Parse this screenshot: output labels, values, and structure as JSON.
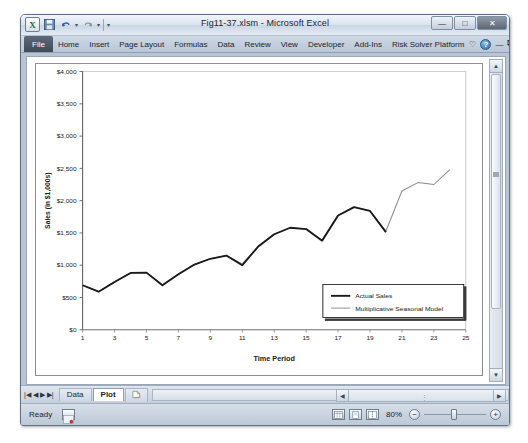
{
  "window": {
    "title": "Fig11-37.xlsm - Microsoft Excel",
    "quick_access": {
      "excel_logo": "X",
      "save_icon": "save-icon",
      "undo_icon": "undo-icon",
      "redo_icon": "redo-icon",
      "customize_icon": "customize-icon"
    },
    "buttons": {
      "minimize": "—",
      "maximize": "□",
      "close": "✕"
    }
  },
  "ribbon": {
    "file_tab": "File",
    "tabs": [
      "Home",
      "Insert",
      "Page Layout",
      "Formulas",
      "Data",
      "Review",
      "View",
      "Developer",
      "Add-Ins",
      "Risk Solver Platform"
    ],
    "right_icons": {
      "collapse": "♡",
      "help": "?",
      "minimize_ribbon": "—",
      "restore_window": "⧉",
      "close_window": "✕"
    }
  },
  "sheet_tabs": {
    "nav": [
      "|◀",
      "◀",
      "▶",
      "▶|"
    ],
    "items": [
      {
        "label": "Data",
        "active": false
      },
      {
        "label": "Plot",
        "active": true
      }
    ],
    "new_sheet_icon": "new-sheet-icon"
  },
  "status_bar": {
    "state": "Ready",
    "macro_record_icon": "macro-record-icon",
    "view_normal": "normal-view-icon",
    "view_page_layout": "page-layout-view-icon",
    "view_page_break": "page-break-view-icon",
    "zoom_level": "80%",
    "zoom_out": "−",
    "zoom_in": "+"
  },
  "scrollbars": {
    "vertical_up": "▲",
    "vertical_down": "▼",
    "horizontal_left": "◀",
    "horizontal_right": "▶"
  },
  "chart_data": {
    "type": "line",
    "title": "",
    "xlabel": "Time Period",
    "ylabel": "Sales (in $1,000s)",
    "xlim": [
      1,
      25
    ],
    "ylim": [
      0,
      4000
    ],
    "ytick_step": 500,
    "ytick_labels": [
      "$0",
      "$500",
      "$1,000",
      "$1,500",
      "$2,000",
      "$2,500",
      "$3,000",
      "$3,500",
      "$4,000"
    ],
    "xtick_labels": [
      "1",
      "3",
      "5",
      "7",
      "9",
      "11",
      "13",
      "15",
      "17",
      "19",
      "21",
      "23",
      "25"
    ],
    "grid": false,
    "legend_position": "inside-bottom-right",
    "x": [
      1,
      2,
      3,
      4,
      5,
      6,
      7,
      8,
      9,
      10,
      11,
      12,
      13,
      14,
      15,
      16,
      17,
      18,
      19,
      20
    ],
    "series": [
      {
        "name": "Actual Sales",
        "color": "#1a1a1a",
        "width": 1.9,
        "x": [
          1,
          2,
          3,
          4,
          5,
          6,
          7,
          8,
          9,
          10,
          11,
          12,
          13,
          14,
          15,
          16,
          17,
          18,
          19,
          20
        ],
        "values": [
          690,
          590,
          740,
          880,
          885,
          690,
          860,
          1010,
          1100,
          1150,
          1000,
          1290,
          1480,
          1580,
          1560,
          1380,
          1770,
          1900,
          1840,
          1510
        ]
      },
      {
        "name": "Multiplicative Seasonal Model",
        "color": "#8c8c8c",
        "width": 1.0,
        "x": [
          1,
          2,
          3,
          4,
          5,
          6,
          7,
          8,
          9,
          10,
          11,
          12,
          13,
          14,
          15,
          16,
          17,
          18,
          19,
          20,
          21,
          22,
          23,
          24
        ],
        "values": [
          690,
          590,
          740,
          880,
          885,
          690,
          860,
          1010,
          1100,
          1150,
          1020,
          1290,
          1480,
          1580,
          1560,
          1390,
          1770,
          1900,
          1840,
          1530,
          2150,
          2280,
          2250,
          2480
        ]
      }
    ],
    "annotations": []
  },
  "chart_values_extended": {
    "note_forecast_tail_real_units": [
      2630,
      2720,
      2700,
      2230,
      3490
    ],
    "series_actual_tail": [
      2150,
      2280,
      2250,
      2630
    ]
  }
}
